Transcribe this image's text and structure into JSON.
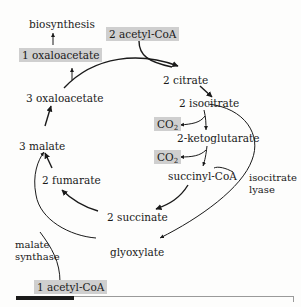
{
  "diagram": {
    "nodes": {
      "biosynthesis": "biosynthesis",
      "oxaloacetate_1": "1 oxaloacetate",
      "acetyl_coa_2": "2 acetyl-CoA",
      "oxaloacetate_3": "3 oxaloacetate",
      "citrate_2": "2 citrate",
      "isocitrate_2": "2 isocitrate",
      "co2_a": "CO",
      "co2_a_sub": "2",
      "ketoglutarate_2": "2-ketoglutarate",
      "co2_b": "CO",
      "co2_b_sub": "2",
      "malate_3": "3 malate",
      "succinyl_coa": "succinyl-CoA",
      "fumarate_2": "2 fumarate",
      "succinate_2": "2 succinate",
      "glyoxylate": "glyoxylate",
      "acetyl_coa_1": "1 acetyl-CoA"
    },
    "enzymes": {
      "isocitrate_lyase_line1": "isocitrate",
      "isocitrate_lyase_line2": "lyase",
      "malate_synthase_line1": "malate",
      "malate_synthase_line2": "synthase"
    },
    "colors": {
      "highlight_box": "#cfcfcf",
      "arrow": "#1a1a1a"
    }
  }
}
